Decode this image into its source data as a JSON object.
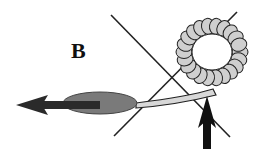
{
  "figure": {
    "panel_label": "B",
    "elements": {
      "ring": {
        "name": "beaded-ring",
        "cx": 212,
        "cy": 52,
        "r": 28,
        "bead_count": 22,
        "fill": "#cfcfcf"
      },
      "tail": {
        "name": "tail-strand",
        "fill": "#d8d8d8"
      },
      "body": {
        "name": "ellipse-body",
        "cx": 100,
        "cy": 103,
        "rx": 37,
        "ry": 11,
        "fill": "#7a7a7a"
      },
      "left_arrow": {
        "name": "left-arrow",
        "direction": "left",
        "color": "#2a2a2a"
      },
      "up_arrow": {
        "name": "up-arrow",
        "direction": "up",
        "color": "#111111"
      },
      "cross_lines": {
        "name": "x-cross",
        "color": "#222222"
      }
    },
    "colors": {
      "background": "#ffffff",
      "ring_bead": "#cfcfcf",
      "outline": "#222222",
      "ellipse": "#7a7a7a",
      "arrow": "#1a1a1a"
    }
  }
}
